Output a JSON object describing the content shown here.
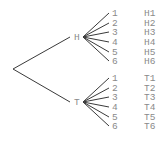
{
  "diagram": {
    "type": "probability-tree",
    "root": {
      "x": 13,
      "y": 69
    },
    "colors": {
      "edge": "#3a3a3a",
      "text": "#8a8a8a",
      "background": "#ffffff"
    },
    "branches": [
      {
        "label": "H",
        "label_pos": {
          "x": 71,
          "y": 40
        },
        "node": {
          "x": 83,
          "y": 37
        },
        "leaves": [
          {
            "label": "1",
            "y": 13,
            "outcome": "H1"
          },
          {
            "label": "2",
            "y": 23,
            "outcome": "H2"
          },
          {
            "label": "3",
            "y": 32,
            "outcome": "H3"
          },
          {
            "label": "4",
            "y": 42,
            "outcome": "H4"
          },
          {
            "label": "5",
            "y": 52,
            "outcome": "H5"
          },
          {
            "label": "6",
            "y": 61,
            "outcome": "H6"
          }
        ]
      },
      {
        "label": "T",
        "label_pos": {
          "x": 71,
          "y": 105
        },
        "node": {
          "x": 83,
          "y": 102
        },
        "leaves": [
          {
            "label": "1",
            "y": 78,
            "outcome": "T1"
          },
          {
            "label": "2",
            "y": 88,
            "outcome": "T2"
          },
          {
            "label": "3",
            "y": 97,
            "outcome": "T3"
          },
          {
            "label": "4",
            "y": 107,
            "outcome": "T4"
          },
          {
            "label": "5",
            "y": 117,
            "outcome": "T5"
          },
          {
            "label": "6",
            "y": 126,
            "outcome": "T6"
          }
        ]
      }
    ],
    "leaf_x": 109,
    "leaf_label_x": 112,
    "outcome_x": 144
  }
}
